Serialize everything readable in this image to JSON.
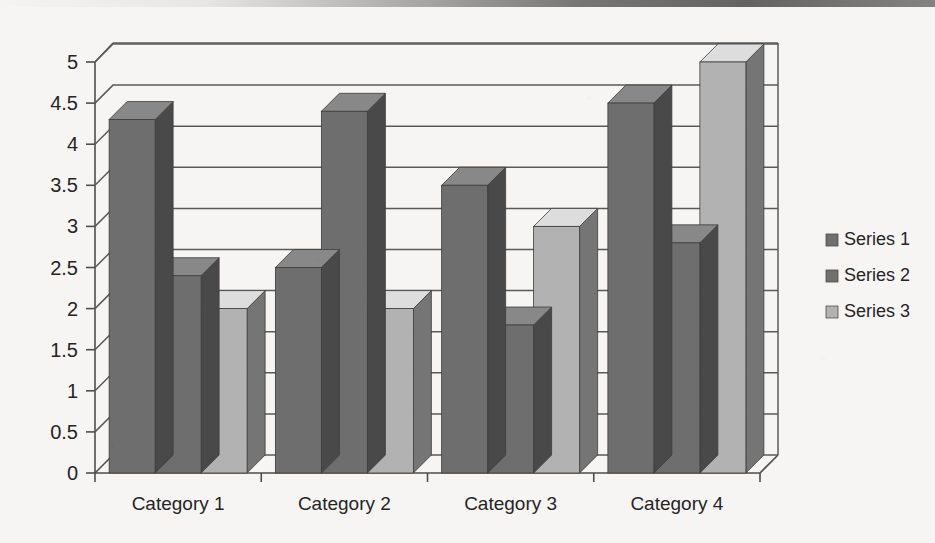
{
  "chart_data": {
    "type": "bar",
    "title": "",
    "subtitle": "",
    "xlabel": "",
    "ylabel": "",
    "categories": [
      "Category 1",
      "Category 2",
      "Category 3",
      "Category 4"
    ],
    "series": [
      {
        "name": "Series 1",
        "values": [
          4.3,
          2.5,
          3.5,
          4.5
        ],
        "color": "#6e6e6e"
      },
      {
        "name": "Series 2",
        "values": [
          2.4,
          4.4,
          1.8,
          2.8
        ],
        "color": "#6e6e6e"
      },
      {
        "name": "Series 3",
        "values": [
          2.0,
          2.0,
          3.0,
          5.0
        ],
        "color": "#b2b2b2"
      }
    ],
    "ylim": [
      0,
      5
    ],
    "yticks": [
      "0",
      "0.5",
      "1",
      "1.5",
      "2",
      "2.5",
      "3",
      "3.5",
      "4",
      "4.5",
      "5"
    ],
    "ytick_values": [
      0,
      0.5,
      1,
      1.5,
      2,
      2.5,
      3,
      3.5,
      4,
      4.5,
      5
    ],
    "grid": true,
    "legend": {
      "position": "right",
      "entries": [
        {
          "label": "Series 1",
          "swatch_color": "#6e6e6e"
        },
        {
          "label": "Series 2",
          "swatch_color": "#707070"
        },
        {
          "label": "Series 3",
          "swatch_color": "#b2b2b2"
        }
      ]
    },
    "style": {
      "three_d": true,
      "plot_background": "#f6f5f3",
      "gridline_color": "#5a5a5a",
      "axis_color": "#4e4e4e",
      "bar_top_color": "#8a8a8a",
      "bar_side_color": "#4a4a4a",
      "bar_top_color_light": "#c9c9c9",
      "bar_side_color_light": "#8d8d8d"
    }
  },
  "legend": {
    "entries": [
      {
        "label": "Series 1"
      },
      {
        "label": "Series 2"
      },
      {
        "label": "Series 3"
      }
    ]
  },
  "axes": {
    "y_labels": [
      "5",
      "4.5",
      "4",
      "3.5",
      "3",
      "2.5",
      "2",
      "1.5",
      "1",
      "0.5",
      "0"
    ],
    "x_labels": [
      "Category 1",
      "Category 2",
      "Category 3",
      "Category 4"
    ]
  }
}
